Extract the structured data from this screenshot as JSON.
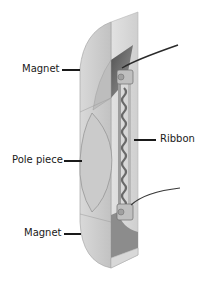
{
  "diagram": {
    "labels": {
      "magnet_top": "Magnet",
      "ribbon": "Ribbon",
      "pole_piece": "Pole piece",
      "magnet_bottom": "Magnet"
    },
    "colors": {
      "background": "#ffffff",
      "magnet_light": "#d6d6d6",
      "magnet_mid": "#c4c4c4",
      "magnet_dark": "#6e6e6e",
      "pole_piece": "#cdcdcd",
      "wire": "#2a2a2a",
      "text": "#1a1a1a"
    }
  }
}
